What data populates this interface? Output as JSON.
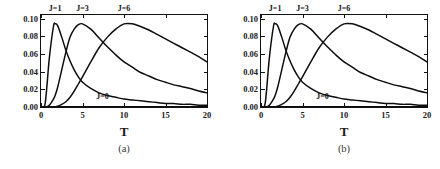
{
  "figure": {
    "caption_a": "(a)",
    "caption_b": "(b)",
    "xlabel": "T"
  },
  "panels": [
    {
      "id": "a",
      "caption": "(a)",
      "ylabel": "I(X;Y|Z=1)",
      "xlabel": "T"
    },
    {
      "id": "b",
      "caption": "(b)",
      "ylabel": "I(X;Y|Z)",
      "xlabel": "T"
    }
  ],
  "axis": {
    "yticks": [
      "0.10",
      "0.08",
      "0.06",
      "0.04",
      "0.02",
      "0.00"
    ],
    "xticks": [
      "0",
      "5",
      "10",
      "15",
      "20"
    ],
    "ylim": [
      0.0,
      0.104
    ],
    "xlim": [
      0,
      20
    ],
    "ymajor_step": 0.02,
    "xmajor_step": 5
  },
  "chart_data": {
    "type": "line",
    "title": "",
    "xlabel": "T",
    "ylabel": "I(X;Y|Z=1)",
    "ylabel_b": "I(X;Y|Z)",
    "xlim": [
      0,
      20
    ],
    "ylim": [
      0.0,
      0.104
    ],
    "grid": false,
    "legend": "inline-curve-labels",
    "annotations": [
      "J=1",
      "J=3",
      "J=6",
      "J=0"
    ],
    "x": [
      0,
      0.5,
      1,
      1.5,
      1.7,
      2,
      2.5,
      3,
      3.5,
      4,
      4.5,
      5,
      6,
      7,
      8,
      9,
      10,
      11,
      12,
      13,
      14,
      15,
      16,
      17,
      18,
      19,
      20
    ],
    "series": [
      {
        "name": "J=0",
        "label": "J=0",
        "peak_T": null,
        "peak_value": 0.0,
        "values": [
          0,
          0,
          0,
          0,
          0,
          0,
          0,
          0,
          0,
          0,
          0,
          0,
          0,
          0,
          0,
          0,
          0,
          0,
          0,
          0,
          0,
          0,
          0,
          0,
          0,
          0,
          0
        ]
      },
      {
        "name": "J=1",
        "label": "J=1",
        "peak_T": 1.7,
        "peak_value": 0.094,
        "values": [
          0,
          0.004,
          0.055,
          0.091,
          0.094,
          0.092,
          0.079,
          0.064,
          0.052,
          0.042,
          0.034,
          0.028,
          0.021,
          0.016,
          0.013,
          0.011,
          0.009,
          0.008,
          0.007,
          0.006,
          0.005,
          0.004,
          0.004,
          0.003,
          0.003,
          0.002,
          0.002
        ]
      },
      {
        "name": "J=3",
        "label": "J=3",
        "peak_T": 5.0,
        "peak_value": 0.094,
        "values": [
          0,
          0,
          0.002,
          0.009,
          0.013,
          0.022,
          0.042,
          0.062,
          0.079,
          0.088,
          0.093,
          0.094,
          0.088,
          0.078,
          0.068,
          0.059,
          0.051,
          0.045,
          0.039,
          0.035,
          0.031,
          0.028,
          0.025,
          0.023,
          0.021,
          0.018,
          0.016
        ]
      },
      {
        "name": "J=6",
        "label": "J=6",
        "peak_T": 10.0,
        "peak_value": 0.094,
        "values": [
          0,
          0,
          0,
          0,
          0,
          0.001,
          0.003,
          0.006,
          0.011,
          0.018,
          0.026,
          0.034,
          0.051,
          0.067,
          0.079,
          0.088,
          0.094,
          0.094,
          0.091,
          0.087,
          0.082,
          0.077,
          0.072,
          0.067,
          0.062,
          0.057,
          0.051
        ]
      }
    ]
  },
  "curve_labels": [
    {
      "text": "J=1",
      "x_data": 1.7,
      "y_px_top": 0
    },
    {
      "text": "J=3",
      "x_data": 5.0,
      "y_px_top": 0
    },
    {
      "text": "J=6",
      "x_data": 10.0,
      "y_px_top": 0
    },
    {
      "text": "J=0",
      "x_data": 7.3,
      "y_px_top": 0
    }
  ]
}
